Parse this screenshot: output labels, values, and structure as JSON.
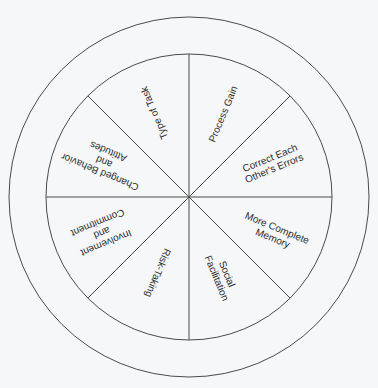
{
  "diagram": {
    "center": [
      189,
      197
    ],
    "inner_radius": 143,
    "outer_radius": 180,
    "line_color": "#4a4a4a",
    "background": "#f6f7f8",
    "sectors": [
      {
        "name": "process-gain",
        "lines": [
          "Process Gain"
        ],
        "angle": -67.5,
        "radius": 90
      },
      {
        "name": "correct-each-others-errors",
        "lines": [
          "Correct Each",
          "Other's Errors"
        ],
        "angle": -22.5,
        "radius": 90
      },
      {
        "name": "more-complete-memory",
        "lines": [
          "More Complete",
          "Memory"
        ],
        "angle": 22.5,
        "radius": 93
      },
      {
        "name": "social-facilitation",
        "lines": [
          "Social",
          "Facilitation"
        ],
        "angle": 67.5,
        "radius": 86
      },
      {
        "name": "risk-taking",
        "lines": [
          "Risk-Taking"
        ],
        "angle": 112.5,
        "radius": 82
      },
      {
        "name": "involvement-and-commitment",
        "lines": [
          "Involvement",
          "and",
          "Commitment"
        ],
        "angle": 157.5,
        "radius": 94
      },
      {
        "name": "changed-behavior-and-attitudes",
        "lines": [
          "Changed Behavior",
          "and",
          "Attitudes"
        ],
        "angle": 202.5,
        "radius": 92
      },
      {
        "name": "type-of-task",
        "lines": [
          "Type of Task"
        ],
        "angle": 247.5,
        "radius": 91
      }
    ]
  }
}
